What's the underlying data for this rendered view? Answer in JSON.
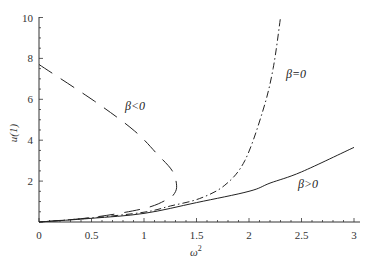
{
  "chart_data": {
    "type": "line",
    "title": "",
    "xlabel": "ω²",
    "ylabel": "u(1)",
    "xlim": [
      0,
      3
    ],
    "ylim": [
      0,
      10
    ],
    "grid": false,
    "legend": "inline labels",
    "x_ticks": [
      0,
      0.5,
      1,
      1.5,
      2,
      2.5,
      3
    ],
    "x_tick_labels": [
      "0",
      "0.5",
      "1",
      "1.5",
      "2",
      "2.5",
      "3"
    ],
    "y_ticks": [
      2,
      4,
      6,
      8,
      10
    ],
    "y_tick_labels": [
      "2",
      "4",
      "6",
      "8",
      "10"
    ],
    "series": [
      {
        "name": "β>0",
        "style": "solid",
        "points": [
          [
            0,
            0
          ],
          [
            0.5,
            0.18
          ],
          [
            1,
            0.42
          ],
          [
            1.5,
            0.95
          ],
          [
            2,
            1.5
          ],
          [
            2.2,
            1.9
          ],
          [
            2.5,
            2.45
          ],
          [
            3,
            3.65
          ]
        ]
      },
      {
        "name": "β=0",
        "style": "dash-dot",
        "points": [
          [
            0,
            0
          ],
          [
            0.5,
            0.2
          ],
          [
            1,
            0.48
          ],
          [
            1.25,
            0.78
          ],
          [
            1.53,
            1.15
          ],
          [
            1.77,
            1.8
          ],
          [
            1.96,
            3.0
          ],
          [
            2.13,
            5.4
          ],
          [
            2.23,
            7.5
          ],
          [
            2.3,
            10
          ]
        ]
      },
      {
        "name": "β<0",
        "style": "dashed",
        "points": [
          [
            0,
            7.7
          ],
          [
            0.53,
            5.9
          ],
          [
            0.91,
            4.45
          ],
          [
            1.13,
            3.3
          ],
          [
            1.27,
            2.5
          ],
          [
            1.31,
            1.8
          ],
          [
            1.29,
            1.4
          ],
          [
            1.22,
            1.1
          ],
          [
            1.0,
            0.66
          ],
          [
            0.5,
            0.22
          ],
          [
            0,
            0
          ]
        ]
      }
    ],
    "annotations": [
      {
        "text": "β<0",
        "x": 0.9,
        "y": 5.6
      },
      {
        "text": "β=0",
        "x": 2.35,
        "y": 7.3
      },
      {
        "text": "β>0",
        "x": 2.45,
        "y": 1.8
      }
    ]
  },
  "labels": {
    "xlabel": "ω",
    "xlabel_sup": "2",
    "ylabel": "u(1)",
    "beta_neg": "β<0",
    "beta_zero": "β=0",
    "beta_pos": "β>0"
  }
}
